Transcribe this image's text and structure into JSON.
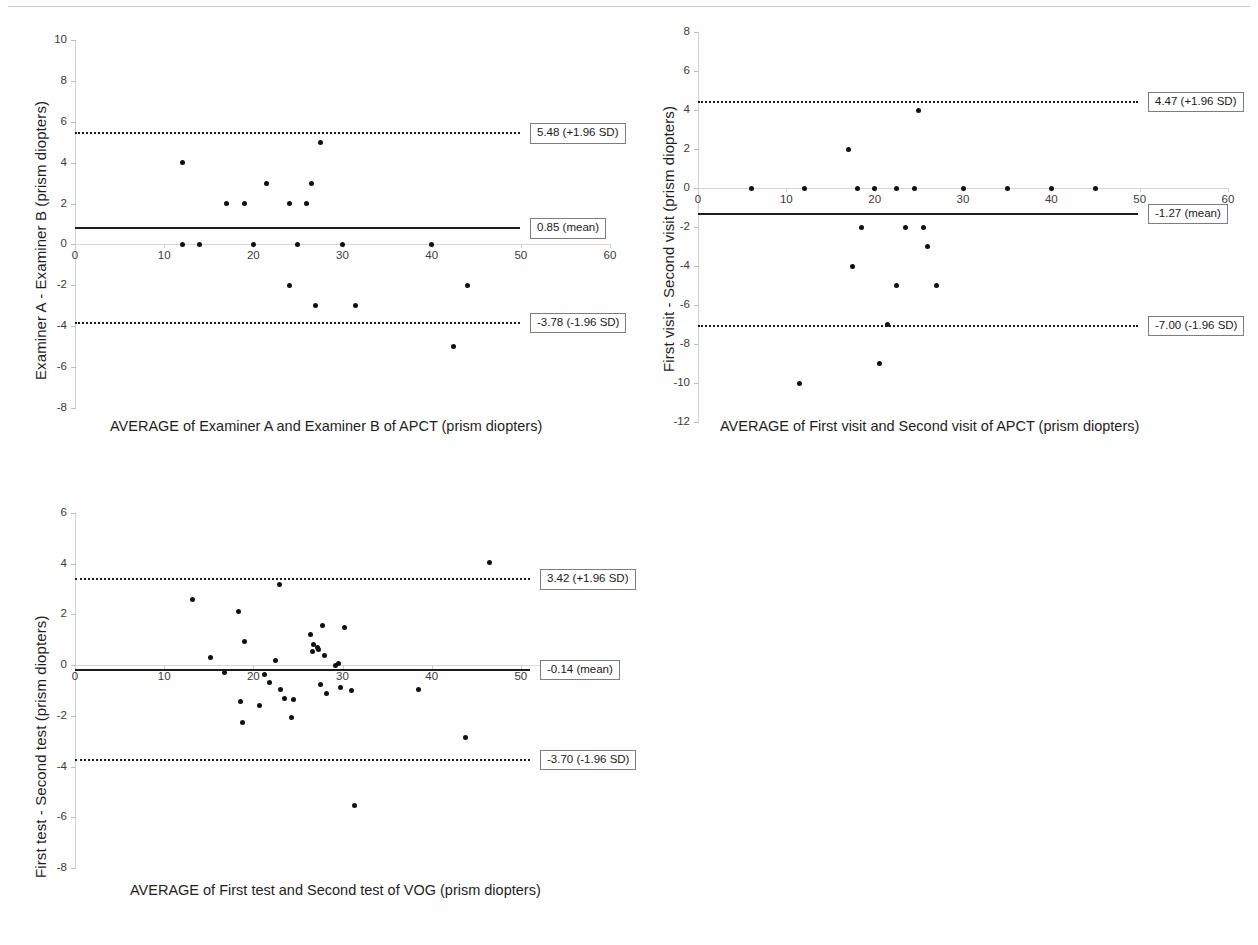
{
  "figure": {
    "background": "#fefefe",
    "marker_color": "#111111",
    "line_color": "#1c1c1c",
    "axis_color": "#d2d2d2"
  },
  "chart_data": [
    {
      "id": "examiner-apct",
      "type": "scatter",
      "title": "",
      "xlabel": "AVERAGE of Examiner A and Examiner B of APCT (prism diopters)",
      "ylabel": "Examiner A - Examiner B (prism diopters)",
      "xlim": [
        0,
        60
      ],
      "ylim": [
        -8,
        10
      ],
      "xticks": [
        0,
        10,
        20,
        30,
        40,
        50,
        60
      ],
      "yticks": [
        -8,
        -6,
        -4,
        -2,
        0,
        2,
        4,
        6,
        8,
        10
      ],
      "grid": false,
      "legend": "none",
      "x": [
        12.0,
        14.0,
        17.0,
        19.0,
        20.0,
        21.5,
        24.0,
        24.0,
        25.0,
        25.0,
        26.0,
        26.5,
        27.5,
        30.0,
        31.5,
        40.0,
        42.5,
        44.0,
        27.0
      ],
      "y": [
        0.0,
        0.0,
        2.0,
        2.0,
        0.0,
        3.0,
        2.0,
        -2.0,
        0.0,
        0.0,
        2.0,
        3.0,
        5.0,
        0.0,
        -3.0,
        0.0,
        -5.0,
        -2.0,
        -3.0
      ],
      "points": [
        {
          "x": 12.0,
          "y": 4.0
        },
        {
          "x": 12.0,
          "y": 0.0
        },
        {
          "x": 14.0,
          "y": 0.0
        },
        {
          "x": 17.0,
          "y": 2.0
        },
        {
          "x": 19.0,
          "y": 2.0
        },
        {
          "x": 20.0,
          "y": 0.0
        },
        {
          "x": 21.5,
          "y": 3.0
        },
        {
          "x": 24.0,
          "y": 2.0
        },
        {
          "x": 24.0,
          "y": -2.0
        },
        {
          "x": 25.0,
          "y": 0.0
        },
        {
          "x": 26.0,
          "y": 2.0
        },
        {
          "x": 26.5,
          "y": 3.0
        },
        {
          "x": 27.0,
          "y": -3.0
        },
        {
          "x": 27.5,
          "y": 5.0
        },
        {
          "x": 30.0,
          "y": 0.0
        },
        {
          "x": 31.5,
          "y": -3.0
        },
        {
          "x": 40.0,
          "y": 0.0
        },
        {
          "x": 42.5,
          "y": -5.0
        },
        {
          "x": 44.0,
          "y": -2.0
        }
      ],
      "reference_lines": [
        {
          "name": "upper-sd",
          "value": 5.48,
          "label": "5.48 (+1.96 SD)",
          "style": "dotted"
        },
        {
          "name": "mean",
          "value": 0.85,
          "label": "0.85 (mean)",
          "style": "solid"
        },
        {
          "name": "lower-sd",
          "value": -3.78,
          "label": "-3.78 (-1.96 SD)",
          "style": "dotted"
        }
      ]
    },
    {
      "id": "visit-apct",
      "type": "scatter",
      "title": "",
      "xlabel": "AVERAGE of First visit and Second visit of APCT (prism diopters)",
      "ylabel": "First visit - Second visit (prism diopters)",
      "xlim": [
        0,
        60
      ],
      "ylim": [
        -12,
        8
      ],
      "xticks": [
        0,
        10,
        20,
        30,
        40,
        50,
        60
      ],
      "yticks": [
        -12,
        -10,
        -8,
        -6,
        -4,
        -2,
        0,
        2,
        4,
        6,
        8
      ],
      "grid": false,
      "legend": "none",
      "points": [
        {
          "x": 6.0,
          "y": 0.0
        },
        {
          "x": 11.5,
          "y": -10.0
        },
        {
          "x": 12.0,
          "y": 0.0
        },
        {
          "x": 17.0,
          "y": 2.0
        },
        {
          "x": 18.0,
          "y": 0.0
        },
        {
          "x": 18.5,
          "y": -2.0
        },
        {
          "x": 17.5,
          "y": -4.0
        },
        {
          "x": 20.0,
          "y": 0.0
        },
        {
          "x": 20.5,
          "y": -9.0
        },
        {
          "x": 21.5,
          "y": -7.0
        },
        {
          "x": 22.5,
          "y": 0.0
        },
        {
          "x": 22.5,
          "y": -5.0
        },
        {
          "x": 23.5,
          "y": -2.0
        },
        {
          "x": 24.5,
          "y": 0.0
        },
        {
          "x": 25.0,
          "y": 4.0
        },
        {
          "x": 25.5,
          "y": -2.0
        },
        {
          "x": 26.0,
          "y": -3.0
        },
        {
          "x": 27.0,
          "y": -5.0
        },
        {
          "x": 30.0,
          "y": 0.0
        },
        {
          "x": 35.0,
          "y": 0.0
        },
        {
          "x": 40.0,
          "y": 0.0
        },
        {
          "x": 45.0,
          "y": 0.0
        }
      ],
      "reference_lines": [
        {
          "name": "upper-sd",
          "value": 4.47,
          "label": "4.47 (+1.96 SD)",
          "style": "dotted"
        },
        {
          "name": "mean",
          "value": -1.27,
          "label": "-1.27 (mean)",
          "style": "solid"
        },
        {
          "name": "lower-sd",
          "value": -7.0,
          "label": "-7.00 (-1.96 SD)",
          "style": "dotted"
        }
      ]
    },
    {
      "id": "test-vog",
      "type": "scatter",
      "title": "",
      "xlabel": "AVERAGE of First test and Second test of VOG (prism diopters)",
      "ylabel": "First test - Second test (prism diopters)",
      "xlim": [
        0,
        60
      ],
      "ylim": [
        -8,
        6
      ],
      "xticks": [
        0,
        10,
        20,
        30,
        40,
        50,
        60
      ],
      "yticks": [
        -8,
        -6,
        -4,
        -2,
        0,
        2,
        4,
        6
      ],
      "grid": false,
      "legend": "none",
      "points": [
        {
          "x": 13.2,
          "y": 2.6
        },
        {
          "x": 15.2,
          "y": 0.3
        },
        {
          "x": 16.8,
          "y": -0.3
        },
        {
          "x": 18.3,
          "y": 2.1
        },
        {
          "x": 18.6,
          "y": -1.45
        },
        {
          "x": 18.8,
          "y": -2.25
        },
        {
          "x": 19.0,
          "y": 0.95
        },
        {
          "x": 20.7,
          "y": -1.6
        },
        {
          "x": 21.3,
          "y": -0.35
        },
        {
          "x": 21.8,
          "y": -0.7
        },
        {
          "x": 22.5,
          "y": 0.2
        },
        {
          "x": 22.9,
          "y": 3.2
        },
        {
          "x": 23.0,
          "y": -0.95
        },
        {
          "x": 23.5,
          "y": -1.3
        },
        {
          "x": 24.3,
          "y": -2.05
        },
        {
          "x": 24.5,
          "y": -1.35
        },
        {
          "x": 26.4,
          "y": 1.2
        },
        {
          "x": 26.6,
          "y": 0.55
        },
        {
          "x": 26.8,
          "y": 0.8
        },
        {
          "x": 27.2,
          "y": 0.7
        },
        {
          "x": 27.3,
          "y": 0.6
        },
        {
          "x": 27.5,
          "y": -0.75
        },
        {
          "x": 27.8,
          "y": 1.55
        },
        {
          "x": 28.0,
          "y": 0.4
        },
        {
          "x": 28.2,
          "y": -1.1
        },
        {
          "x": 29.2,
          "y": 0.0
        },
        {
          "x": 29.6,
          "y": 0.05
        },
        {
          "x": 29.8,
          "y": -0.9
        },
        {
          "x": 30.2,
          "y": 1.5
        },
        {
          "x": 31.0,
          "y": -1.0
        },
        {
          "x": 31.4,
          "y": -5.55
        },
        {
          "x": 38.5,
          "y": -0.95
        },
        {
          "x": 43.8,
          "y": -2.85
        },
        {
          "x": 46.5,
          "y": 4.05
        }
      ],
      "reference_lines": [
        {
          "name": "upper-sd",
          "value": 3.42,
          "label": "3.42 (+1.96 SD)",
          "style": "dotted"
        },
        {
          "name": "mean",
          "value": -0.14,
          "label": "-0.14 (mean)",
          "style": "solid"
        },
        {
          "name": "lower-sd",
          "value": -3.7,
          "label": "-3.70 (-1.96 SD)",
          "style": "dotted"
        }
      ]
    }
  ]
}
